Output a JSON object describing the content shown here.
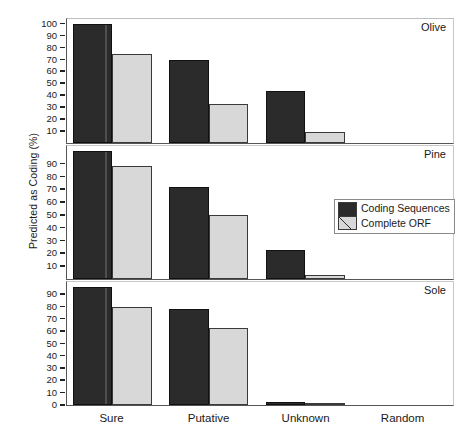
{
  "chart_data": {
    "type": "bar",
    "title": "",
    "xlabel": "",
    "ylabel": "Predicted as Coding (%)",
    "categories": [
      "Sure",
      "Putative",
      "Unknown",
      "Random"
    ],
    "legend": {
      "position": "middle-right",
      "entries": [
        {
          "name": "Coding Sequences",
          "color": "#2b2b2b",
          "pattern": "solid-dark"
        },
        {
          "name": "Complete ORF",
          "color": "#d8d8d8",
          "pattern": "light-with-diagonal"
        }
      ]
    },
    "grid": false,
    "panels": [
      {
        "name": "Olive",
        "ylim": [
          0,
          104
        ],
        "yticks": [
          10,
          20,
          30,
          40,
          50,
          60,
          70,
          80,
          90,
          100
        ],
        "series": [
          {
            "name": "Coding Sequences",
            "values": [
              100,
              70,
              44,
              0
            ]
          },
          {
            "name": "Complete ORF",
            "values": [
              75,
              33,
              9.5,
              0
            ]
          }
        ]
      },
      {
        "name": "Pine",
        "ylim": [
          0,
          104
        ],
        "yticks": [
          10,
          20,
          30,
          40,
          50,
          60,
          70,
          80,
          90
        ],
        "series": [
          {
            "name": "Coding Sequences",
            "values": [
              100,
              72,
              23,
              0
            ]
          },
          {
            "name": "Complete ORF",
            "values": [
              88.5,
              50,
              3.5,
              0
            ]
          }
        ]
      },
      {
        "name": "Sole",
        "ylim": [
          0,
          100
        ],
        "yticks": [
          0,
          10,
          20,
          30,
          40,
          50,
          60,
          70,
          80,
          90
        ],
        "series": [
          {
            "name": "Coding Sequences",
            "values": [
              96,
              78,
              2.5,
              0
            ]
          },
          {
            "name": "Complete ORF",
            "values": [
              80,
              63,
              1,
              0
            ]
          }
        ]
      }
    ]
  }
}
